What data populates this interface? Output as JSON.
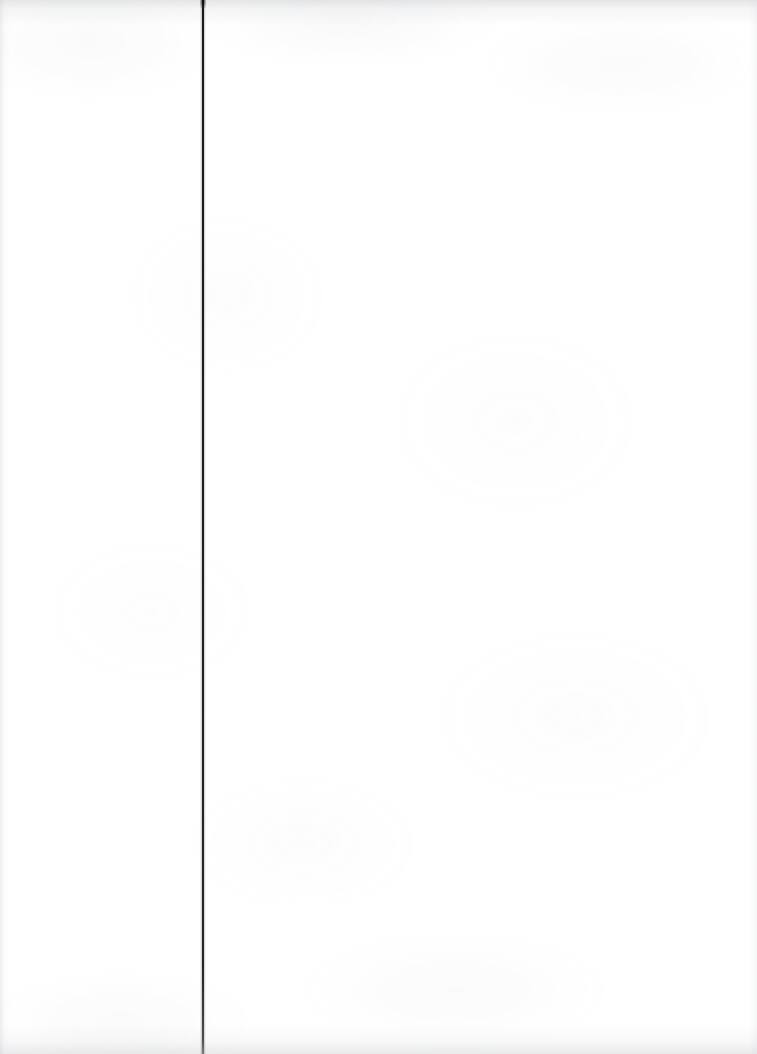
{
  "page": {
    "kind": "scanned-blank-page",
    "width": 757,
    "height": 1054,
    "background_color": "#ffffff",
    "caption": "",
    "body_text": "",
    "page_number": ""
  },
  "gutter_rule": {
    "name": "binding-gutter-line",
    "orientation": "vertical",
    "x": 202,
    "thickness": 2,
    "color": "#1b1b1b",
    "top": 0,
    "bottom": 1054,
    "label": ""
  },
  "texture": {
    "paper_tone": "#fefefe",
    "grain_color": "#a8a8ae",
    "edge_shadow_color": "#bcbec2",
    "top_band_height": 26,
    "bottom_band_height": 30
  },
  "content": {
    "headings": [],
    "paragraphs": [],
    "figures": [],
    "tables": [],
    "footnotes": []
  }
}
